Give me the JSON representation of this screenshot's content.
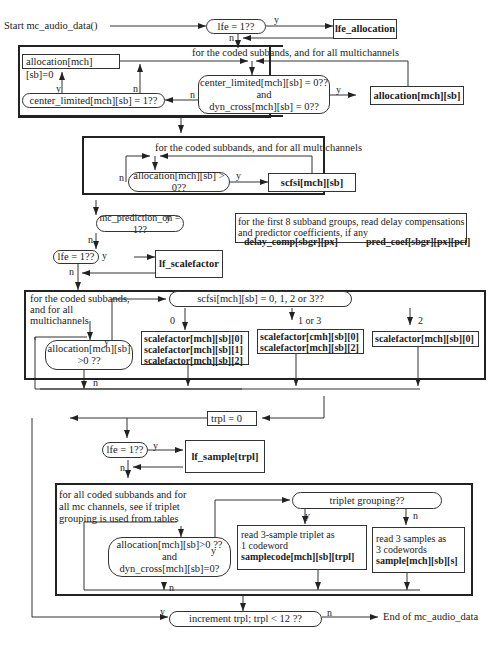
{
  "start": "Start mc_audio_data()",
  "end": "End of mc_audio_data",
  "section1": {
    "lfe_test": "lfe = 1??",
    "lfe_allocation": "lfe_allocation",
    "loop_label": "for the coded subbands, and for all multichannels",
    "alloc_zero": "allocation[mch][sb]=0",
    "center_test": "center_limited[mch][sb] = 1??",
    "cond_line1": "center_limited[mch][sb] = 0??",
    "cond_line2": "and",
    "cond_line3": "dyn_cross[mch][sb] = 0??",
    "allocation": "allocation[mch][sb]"
  },
  "section2": {
    "loop_label": "for the coded subbands, and for all multichannels",
    "alloc_test": "allocation[mch][sb] > 0??",
    "scfsi": "scfsi[mch][sb]"
  },
  "prediction": {
    "test": "mc_prediction_on = 1??",
    "desc_line1": "for the first 8 subband groups, read delay compensations",
    "desc_line2": "and predictor coefficients, if any",
    "delay_comp": "delay_comp[sbgr][px]",
    "pred_coef": "pred_coef[sbgr][px][pci]"
  },
  "lfe2": {
    "test": "lfe = 1??",
    "action": "lf_scalefactor"
  },
  "section3": {
    "loop_line1": "for the coded subbands,",
    "loop_line2": "and for all",
    "loop_line3": "multichannels",
    "scfsi_test": "scfsi[mch][sb] = 0, 1, 2 or 3??",
    "alloc_line1": "allocation[mch][sb]",
    "alloc_line2": ">0 ??",
    "branch0_label": "0",
    "branch13_label": "1 or 3",
    "branch2_label": "2",
    "sf0": [
      "scalefactor[mch][sb][0]",
      "scalefactor[mch][sb][1]",
      "scalefactor[mch][sb][2]"
    ],
    "sf13": [
      "scalefactor[cmh][sb][0]",
      "scalefactor[mch][sb][2]"
    ],
    "sf2": "scalefactor[mch][sb][0]"
  },
  "trpl_init": "trpl = 0",
  "lfe3": {
    "test": "lfe = 1??",
    "action": "lf_sample[trpl]"
  },
  "section4": {
    "loop_line1": "for  all coded subbands and for",
    "loop_line2": "all mc channels, see if triplet",
    "loop_line3": "grouping is used from tables",
    "cond_line1": "allocation[mch][sb]>0 ??",
    "cond_line2": "and",
    "cond_line3": "dyn_cross[mch][sb]=0?",
    "triplet_test": "triplet grouping??",
    "yes_line1": "read 3-sample triplet as",
    "yes_line2": "1 codeword",
    "yes_line3": "samplecode[mch][sb][trpl]",
    "no_line1": "read 3 samples as",
    "no_line2": "3 codewords",
    "no_line3": "sample[mch][sb][s]"
  },
  "increment": "increment trpl;  trpl < 12 ??",
  "labels": {
    "y": "y",
    "n": "n"
  }
}
